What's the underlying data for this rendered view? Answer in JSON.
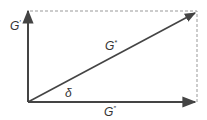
{
  "diagram": {
    "colors": {
      "line": "#444444",
      "dashed": "#999999",
      "text": "#333333"
    },
    "labels": {
      "storage_modulus": {
        "base": "G",
        "sup": "′"
      },
      "complex_modulus": {
        "base": "G",
        "sup": "*"
      },
      "loss_modulus": {
        "base": "G",
        "sup": "″"
      },
      "phase_angle": "δ"
    },
    "geometry": {
      "origin": [
        28,
        102
      ],
      "vertical_arrow_end": [
        28,
        10
      ],
      "horizontal_arrow_end": [
        195,
        102
      ],
      "diagonal_arrow_end": [
        195,
        12
      ],
      "dashed_rect": {
        "x1": 28,
        "y1": 11,
        "x2": 197,
        "y2": 102
      }
    }
  }
}
